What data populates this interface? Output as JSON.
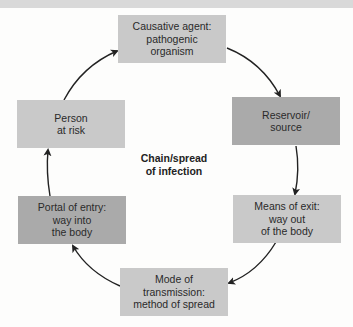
{
  "diagram": {
    "title_lines": [
      "Chain/spread",
      "of infection"
    ],
    "nodes": [
      {
        "id": "causative-agent",
        "lines": [
          "Causative agent:",
          "pathogenic",
          "organism"
        ],
        "shade": "light"
      },
      {
        "id": "reservoir",
        "lines": [
          "Reservoir/",
          "source"
        ],
        "shade": "dark"
      },
      {
        "id": "means-of-exit",
        "lines": [
          "Means of exit:",
          "way out",
          "of the body"
        ],
        "shade": "light"
      },
      {
        "id": "mode-of-transmission",
        "lines": [
          "Mode of",
          "transmission:",
          "method of spread"
        ],
        "shade": "light"
      },
      {
        "id": "portal-of-entry",
        "lines": [
          "Portal of entry:",
          "way into",
          "the body"
        ],
        "shade": "dark"
      },
      {
        "id": "person-at-risk",
        "lines": [
          "Person",
          "at risk"
        ],
        "shade": "light"
      }
    ],
    "edges": [
      {
        "from": "causative-agent",
        "to": "reservoir"
      },
      {
        "from": "reservoir",
        "to": "means-of-exit"
      },
      {
        "from": "means-of-exit",
        "to": "mode-of-transmission"
      },
      {
        "from": "mode-of-transmission",
        "to": "portal-of-entry"
      },
      {
        "from": "portal-of-entry",
        "to": "person-at-risk"
      },
      {
        "from": "person-at-risk",
        "to": "causative-agent"
      }
    ],
    "colors": {
      "light_box": "#c9c9c9",
      "dark_box": "#aaaaaa",
      "arrow": "#222222",
      "background": "#fdfdfc"
    }
  }
}
